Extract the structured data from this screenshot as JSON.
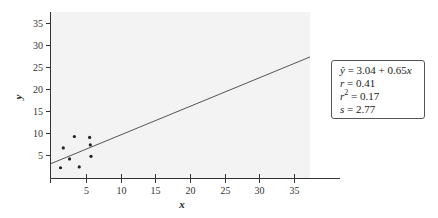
{
  "chart_data": {
    "type": "scatter",
    "title": "",
    "xlabel": "x",
    "ylabel": "y",
    "xlim": [
      0,
      37
    ],
    "ylim": [
      0,
      37
    ],
    "xticks": [
      5,
      10,
      15,
      20,
      25,
      30,
      35
    ],
    "yticks": [
      5,
      10,
      15,
      20,
      25,
      30,
      35
    ],
    "grid": false,
    "points": [
      {
        "x": 1.3,
        "y": 2.1
      },
      {
        "x": 1.7,
        "y": 6.6
      },
      {
        "x": 2.6,
        "y": 4.1
      },
      {
        "x": 3.3,
        "y": 9.2
      },
      {
        "x": 4.0,
        "y": 2.3
      },
      {
        "x": 5.5,
        "y": 9.0
      },
      {
        "x": 5.6,
        "y": 7.3
      },
      {
        "x": 5.7,
        "y": 4.7
      }
    ],
    "regression_line": {
      "intercept": 3.04,
      "slope": 0.65,
      "x_start": 0,
      "x_end": 37.5
    },
    "annotation": {
      "equation": "ŷ = 3.04 + 0.65x",
      "r": "r = 0.41",
      "r_squared": "r² = 0.17",
      "s": "s = 2.77"
    },
    "colors": {
      "plot_background": "#f3f3f3",
      "axis": "#333333",
      "line": "#555555",
      "points": "#222222"
    }
  },
  "stats": {
    "equation_lhs": "ŷ",
    "equation_rhs": " = 3.04 + 0.65",
    "equation_var": "x",
    "r_lhs": "r",
    "r_rhs": " = 0.41",
    "r2_lhs": "r",
    "r2_sup": "2",
    "r2_rhs": " = 0.17",
    "s_lhs": "s",
    "s_rhs": " = 2.77"
  }
}
